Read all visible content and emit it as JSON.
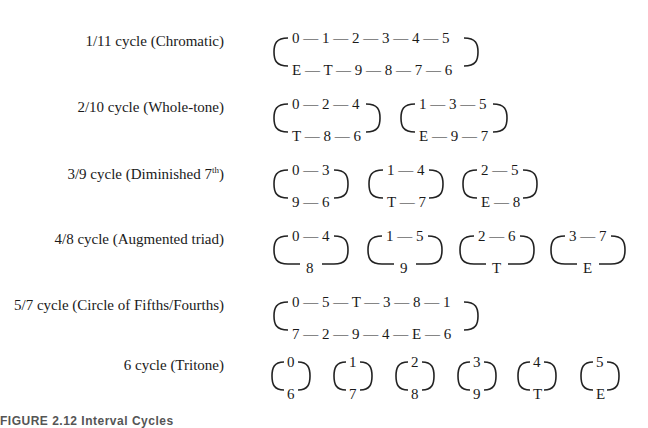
{
  "figure": {
    "caption": "FIGURE 2.12 Interval Cycles",
    "rows": [
      {
        "label": "1/11 cycle (Chromatic)",
        "label_sup": "",
        "cycles": [
          {
            "top": "0 — 1 — 2 — 3 — 4 — 5",
            "bottom": "E — T — 9 — 8 — 7 — 6"
          }
        ]
      },
      {
        "label": "2/10 cycle (Whole-tone)",
        "label_sup": "",
        "cycles": [
          {
            "top": "0 — 2 — 4",
            "bottom": "T — 8 — 6"
          },
          {
            "top": "1 — 3 — 5",
            "bottom": "E — 9 — 7"
          }
        ]
      },
      {
        "label": "3/9 cycle (Diminished 7",
        "label_sup": "th",
        "label_end": ")",
        "cycles": [
          {
            "top": "0 — 3",
            "bottom": "9 — 6"
          },
          {
            "top": "1 — 4",
            "bottom": "T — 7"
          },
          {
            "top": "2 — 5",
            "bottom": "E — 8"
          }
        ]
      },
      {
        "label": "4/8 cycle (Augmented triad)",
        "label_sup": "",
        "cycles": [
          {
            "top": "0 — 4",
            "bottom": "8"
          },
          {
            "top": "1 — 5",
            "bottom": "9"
          },
          {
            "top": "2 — 6",
            "bottom": "T"
          },
          {
            "top": "3 — 7",
            "bottom": "E"
          }
        ]
      },
      {
        "label": "5/7 cycle (Circle of Fifths/Fourths)",
        "label_sup": "",
        "cycles": [
          {
            "top": "0 — 5 — T — 3 — 8 — 1",
            "bottom": "7 — 2 — 9 — 4 — E — 6"
          }
        ]
      },
      {
        "label": "6 cycle (Tritone)",
        "label_sup": "",
        "cycles": [
          {
            "top": "0",
            "bottom": "6"
          },
          {
            "top": "1",
            "bottom": "7"
          },
          {
            "top": "2",
            "bottom": "8"
          },
          {
            "top": "3",
            "bottom": "9"
          },
          {
            "top": "4",
            "bottom": "T"
          },
          {
            "top": "5",
            "bottom": "E"
          }
        ]
      }
    ]
  }
}
